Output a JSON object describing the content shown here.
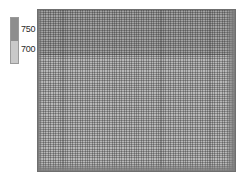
{
  "figure": {
    "background_color": "#ffffff",
    "width": 246,
    "height": 182
  },
  "legend": {
    "name": "colorbar",
    "orientation": "vertical",
    "border_color": "#9a9a9a",
    "bands": [
      {
        "label": "750",
        "color": "#8e8e8e",
        "position": "upper"
      },
      {
        "label": "700",
        "color": "#c9c9c9",
        "position": "lower"
      }
    ],
    "tick_labels": [
      "750",
      "700"
    ],
    "tick_label_color": "#2b2b2b"
  },
  "plot": {
    "name": "mesh-raster",
    "border_color": "#6f6f6f",
    "base_color": "#b4b4b4",
    "upper_band_color": "#8f8f8f",
    "lower_band_color": "#a9a9a9",
    "divider_color": "#6a6a6a",
    "gridline_color_vertical": "rgba(60,60,60,0.40)",
    "gridline_color_horizontal": "rgba(60,60,60,0.34)",
    "cell_pitch_x": 2.45,
    "cell_pitch_y": 2.2,
    "edge_shade_color": "#7d7d7d"
  },
  "chart_data": {
    "type": "heatmap",
    "title": "",
    "xlabel": "",
    "ylabel": "",
    "grid": true,
    "legend_position": "left",
    "colorbar": {
      "tick_values": [
        750,
        700
      ],
      "tick_labels": [
        "750",
        "700"
      ],
      "vmin": 700,
      "vmax": 750,
      "colormap": "grayscale",
      "colors": [
        "#8e8e8e",
        "#c9c9c9"
      ]
    },
    "mesh": {
      "columns": 80,
      "rows": 74,
      "banded_rows": [
        {
          "from_row": 0,
          "to_row": 19,
          "value": 750
        },
        {
          "from_row": 20,
          "to_row": 73,
          "value": 700
        }
      ]
    },
    "x": [],
    "values": []
  }
}
